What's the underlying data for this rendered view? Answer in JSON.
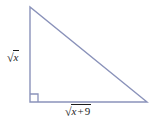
{
  "figure": {
    "name": "right-triangle-diagram",
    "shape": "right triangle",
    "stroke_color": "#8a92ba",
    "text_color": "#1c1c1c",
    "background_color": "#ffffff",
    "vertices": {
      "top": [
        30,
        7
      ],
      "bottom_left": [
        30,
        102
      ],
      "bottom_right": [
        147,
        102
      ]
    },
    "right_angle_marker": {
      "at": "bottom_left",
      "size": 8
    },
    "labels": {
      "vertical_leg": {
        "radical_sign": "√",
        "radicand": "x",
        "full_text": "√x"
      },
      "horizontal_leg": {
        "radical_sign": "√",
        "radicand_variable": "x",
        "radicand_operator": "+",
        "radicand_number": "9",
        "full_text": "√(x + 9)"
      }
    }
  }
}
